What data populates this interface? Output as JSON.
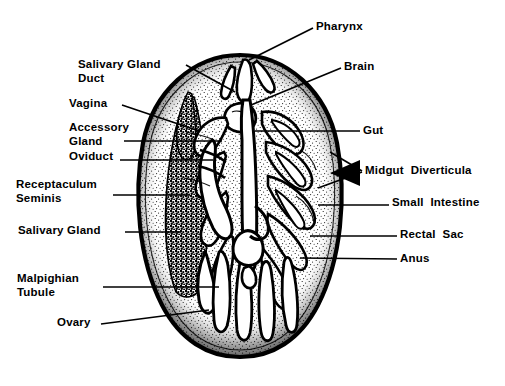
{
  "figure": {
    "kind": "anatomical-diagram",
    "background_color": "#ffffff",
    "ink_color": "#000000"
  },
  "labels": {
    "right": [
      {
        "id": "pharynx",
        "text": "Pharynx"
      },
      {
        "id": "brain",
        "text": "Brain"
      },
      {
        "id": "gut",
        "text": "Gut"
      },
      {
        "id": "midgut",
        "text": "Midgut  Diverticula"
      },
      {
        "id": "small_intestine",
        "text": "Small  Intestine"
      },
      {
        "id": "rectal_sac",
        "text": "Rectal  Sac"
      },
      {
        "id": "anus",
        "text": "Anus"
      }
    ],
    "left": [
      {
        "id": "salivary_gland_duct",
        "line1": "Salivary Gland",
        "line2": "Duct"
      },
      {
        "id": "vagina",
        "line1": "Vagina"
      },
      {
        "id": "accessory_gland",
        "line1": "Accessory",
        "line2": "Gland"
      },
      {
        "id": "oviduct",
        "line1": "Oviduct"
      },
      {
        "id": "receptaculum",
        "line1": "Receptaculum",
        "line2": "Seminis"
      },
      {
        "id": "salivary_gland",
        "line1": "Salivary Gland"
      },
      {
        "id": "malpighian",
        "line1": "Malpighian",
        "line2": "Tubule"
      },
      {
        "id": "ovary",
        "line1": "Ovary"
      }
    ]
  }
}
